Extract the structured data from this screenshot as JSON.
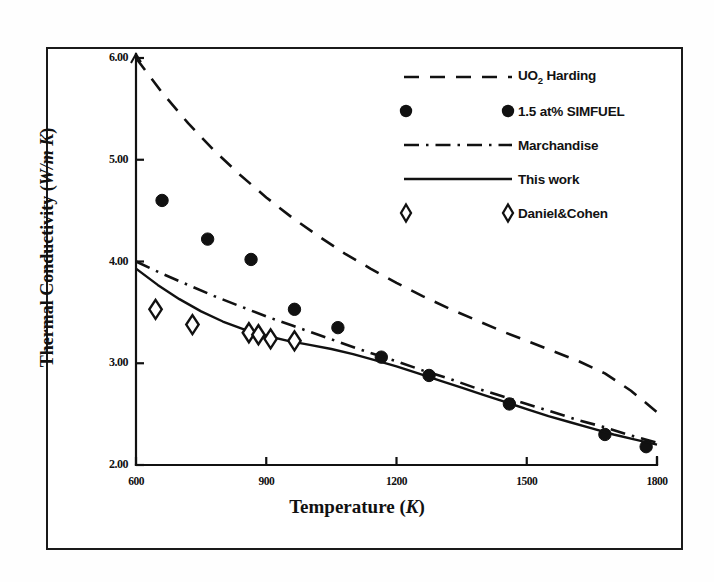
{
  "chart_data": {
    "type": "line",
    "title": "",
    "xlabel": "Temperature (K)",
    "ylabel": "Thermal Conductivity (W/m K)",
    "xlim": [
      600,
      1800
    ],
    "ylim": [
      2.0,
      6.0
    ],
    "xticks": [
      "600",
      "900",
      "1200",
      "1500",
      "1800"
    ],
    "xtick_values": [
      600,
      900,
      1200,
      1500,
      1800
    ],
    "yticks": [
      "2.00",
      "3.00",
      "4.00",
      "5.00",
      "6.00"
    ],
    "ytick_values": [
      2.0,
      3.0,
      4.0,
      5.0,
      6.0
    ],
    "grid": false,
    "legend_position": "upper right",
    "series": [
      {
        "name": "UO2 Harding",
        "label_html": "UO<sub>2</sub> Harding",
        "style": "dashed",
        "marker": "none",
        "color": "#111111",
        "x": [
          600,
          660,
          720,
          780,
          840,
          900,
          960,
          1020,
          1080,
          1140,
          1200,
          1260,
          1320,
          1380,
          1440,
          1500,
          1560,
          1620,
          1680,
          1740,
          1800
        ],
        "y": [
          6.0,
          5.66,
          5.36,
          5.09,
          4.85,
          4.63,
          4.43,
          4.25,
          4.08,
          3.93,
          3.79,
          3.66,
          3.54,
          3.43,
          3.32,
          3.22,
          3.12,
          3.02,
          2.9,
          2.73,
          2.52
        ]
      },
      {
        "name": "1.5 at% SIMFUEL",
        "label_html": "1.5 at% SIMFUEL",
        "style": "none",
        "marker": "filled-circle",
        "color": "#111111",
        "x": [
          660,
          765,
          865,
          965,
          1065,
          1165,
          1275,
          1460,
          1680,
          1775
        ],
        "y": [
          4.6,
          4.22,
          4.02,
          3.53,
          3.35,
          3.06,
          2.88,
          2.6,
          2.3,
          2.18
        ]
      },
      {
        "name": "Marchandise",
        "label_html": "Marchandise",
        "style": "dash-dot",
        "marker": "none",
        "color": "#111111",
        "x": [
          600,
          660,
          720,
          780,
          840,
          900,
          960,
          1020,
          1080,
          1140,
          1200,
          1260,
          1320,
          1380,
          1440,
          1500,
          1560,
          1620,
          1680,
          1740,
          1800
        ],
        "y": [
          4.0,
          3.88,
          3.77,
          3.66,
          3.56,
          3.46,
          3.37,
          3.28,
          3.19,
          3.1,
          3.02,
          2.93,
          2.85,
          2.76,
          2.68,
          2.6,
          2.52,
          2.44,
          2.37,
          2.29,
          2.22
        ]
      },
      {
        "name": "This work",
        "label_html": "This work",
        "style": "solid",
        "marker": "none",
        "color": "#111111",
        "x": [
          600,
          650,
          700,
          750,
          800,
          850,
          900,
          950,
          1000,
          1050,
          1100,
          1150,
          1200,
          1250,
          1300,
          1350,
          1400,
          1450,
          1500,
          1550,
          1600,
          1650,
          1700,
          1750,
          1800
        ],
        "y": [
          3.93,
          3.77,
          3.63,
          3.51,
          3.41,
          3.33,
          3.27,
          3.22,
          3.18,
          3.14,
          3.09,
          3.03,
          2.97,
          2.9,
          2.83,
          2.76,
          2.69,
          2.62,
          2.55,
          2.48,
          2.42,
          2.36,
          2.3,
          2.25,
          2.2
        ]
      },
      {
        "name": "Daniel&Cohen",
        "label_html": "Daniel&Cohen",
        "style": "none",
        "marker": "open-diamond",
        "color": "#111111",
        "x": [
          645,
          730,
          860,
          882,
          910,
          965
        ],
        "y": [
          3.53,
          3.38,
          3.3,
          3.28,
          3.24,
          3.22
        ]
      }
    ]
  },
  "axes": {
    "y_title_main": "Thermal Conductivity (",
    "y_title_units": "W/m K",
    "y_title_close": ")",
    "x_title_main": "Temperature (",
    "x_title_units": "K",
    "x_title_close": ")"
  },
  "legend": {
    "items": [
      {
        "label": "UO2 Harding",
        "marker": "dashed-line"
      },
      {
        "label": "1.5 at% SIMFUEL",
        "marker": "filled-circle"
      },
      {
        "label": "Marchandise",
        "marker": "dash-dot-line"
      },
      {
        "label": "This work",
        "marker": "solid-line"
      },
      {
        "label": "Daniel&Cohen",
        "marker": "open-diamond"
      }
    ]
  }
}
